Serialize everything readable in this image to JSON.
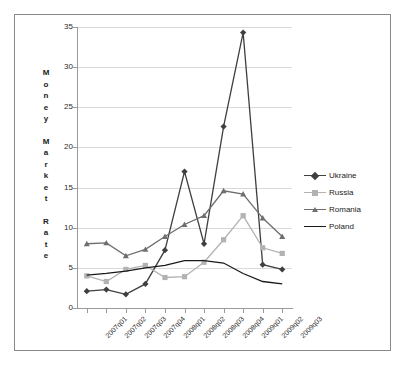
{
  "chart_data": {
    "type": "line",
    "title": "",
    "xlabel": "",
    "ylabel": "Money Market Rate",
    "ylim": [
      0,
      35
    ],
    "yticks": [
      0,
      5,
      10,
      15,
      20,
      25,
      30,
      35
    ],
    "grid": true,
    "legend_position": "right",
    "categories": [
      "2007q01",
      "2007q02",
      "2007q03",
      "2007q04",
      "2008q01",
      "2008q02",
      "2008q03",
      "2008q04",
      "2009q01",
      "2009q02",
      "2009q03"
    ],
    "series": [
      {
        "name": "Ukraine",
        "color": "#3f3f3f",
        "marker": "diamond",
        "values": [
          2.1,
          2.3,
          1.7,
          3.0,
          7.2,
          17.0,
          8.0,
          22.6,
          34.3,
          5.4,
          4.8
        ]
      },
      {
        "name": "Russia",
        "color": "#b2b2b2",
        "marker": "square",
        "values": [
          4.0,
          3.3,
          4.8,
          5.3,
          3.8,
          3.9,
          5.7,
          8.5,
          11.5,
          7.5,
          6.8
        ]
      },
      {
        "name": "Romania",
        "color": "#6e6e6e",
        "marker": "triangle",
        "values": [
          8.0,
          8.1,
          6.5,
          7.3,
          8.9,
          10.4,
          11.5,
          14.6,
          14.2,
          11.2,
          8.9
        ]
      },
      {
        "name": "Poland",
        "color": "#1a1a1a",
        "marker": "none",
        "values": [
          4.1,
          4.3,
          4.6,
          5.0,
          5.3,
          5.9,
          5.9,
          5.6,
          4.3,
          3.3,
          3.0
        ]
      }
    ]
  },
  "legend": {
    "items": [
      {
        "label": "Ukraine"
      },
      {
        "label": "Russia"
      },
      {
        "label": "Romania"
      },
      {
        "label": "Poland"
      }
    ]
  },
  "axis_title_letters": [
    "M",
    "o",
    "n",
    "e",
    "y",
    "",
    "M",
    "a",
    "r",
    "k",
    "e",
    "t",
    "",
    "R",
    "a",
    "t",
    "e"
  ]
}
